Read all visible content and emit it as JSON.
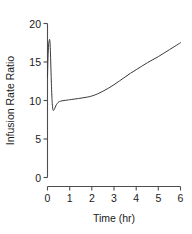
{
  "chart_data": {
    "type": "line",
    "title": "",
    "xlabel": "Time (hr)",
    "ylabel": "Infusion Rate Ratio",
    "xlim": [
      0,
      6
    ],
    "ylim": [
      0,
      20
    ],
    "xticks": [
      0,
      1,
      2,
      3,
      4,
      5,
      6
    ],
    "xtick_labels": [
      "0",
      "1",
      "2",
      "3",
      "4",
      "5",
      "6"
    ],
    "yticks": [
      0,
      5,
      10,
      15,
      20
    ],
    "ytick_labels": [
      "0",
      "5",
      "10",
      "15",
      "20"
    ],
    "grid": false,
    "legend": null,
    "line_color": "#3a3a3a",
    "axis_color": "#4d4d4d",
    "series": [
      {
        "name": "Infusion Rate Ratio",
        "x": [
          0.0,
          0.02,
          0.05,
          0.08,
          0.1,
          0.12,
          0.14,
          0.16,
          0.18,
          0.2,
          0.22,
          0.25,
          0.3,
          0.35,
          0.4,
          0.45,
          0.5,
          0.6,
          0.7,
          0.8,
          0.9,
          1.0,
          1.2,
          1.4,
          1.6,
          1.8,
          2.0,
          2.25,
          2.5,
          2.75,
          3.0,
          3.25,
          3.5,
          3.75,
          4.0,
          4.25,
          4.5,
          4.75,
          5.0,
          5.25,
          5.5,
          5.75,
          6.0
        ],
        "y": [
          13.0,
          15.4,
          17.2,
          17.8,
          17.9,
          17.2,
          15.6,
          13.6,
          11.8,
          10.4,
          9.4,
          8.75,
          8.8,
          9.15,
          9.45,
          9.65,
          9.8,
          9.92,
          9.98,
          10.02,
          10.06,
          10.1,
          10.18,
          10.26,
          10.35,
          10.45,
          10.58,
          10.85,
          11.2,
          11.6,
          12.05,
          12.55,
          13.05,
          13.55,
          14.0,
          14.45,
          14.9,
          15.3,
          15.7,
          16.15,
          16.6,
          17.05,
          17.5
        ]
      }
    ]
  },
  "axes": {
    "y_axis_title": "Infusion Rate Ratio",
    "x_axis_title": "Time (hr)"
  }
}
